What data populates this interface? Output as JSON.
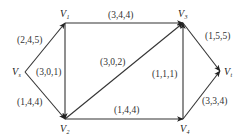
{
  "diagram": {
    "type": "flow-network",
    "nodes": [
      {
        "id": "Vs",
        "label": "V",
        "sub": "s",
        "x": 25,
        "y": 72,
        "lx": 12,
        "ly": 75
      },
      {
        "id": "V1",
        "label": "V",
        "sub": "1",
        "x": 65,
        "y": 23,
        "lx": 60,
        "ly": 17
      },
      {
        "id": "V2",
        "label": "V",
        "sub": "2",
        "x": 65,
        "y": 119,
        "lx": 60,
        "ly": 132
      },
      {
        "id": "V3",
        "label": "V",
        "sub": "3",
        "x": 183,
        "y": 23,
        "lx": 178,
        "ly": 17
      },
      {
        "id": "V4",
        "label": "V",
        "sub": "4",
        "x": 183,
        "y": 119,
        "lx": 180,
        "ly": 132
      },
      {
        "id": "Vt",
        "label": "V",
        "sub": "t",
        "x": 220,
        "y": 71,
        "lx": 224,
        "ly": 75
      }
    ],
    "edges": [
      {
        "from": "Vs",
        "to": "V1",
        "label": "(2,4,5)",
        "lx": 17,
        "ly": 43
      },
      {
        "from": "Vs",
        "to": "V2",
        "label": "(1,4,4)",
        "lx": 17,
        "ly": 105
      },
      {
        "from": "V1",
        "to": "V2",
        "label": "(3,0,1)",
        "lx": 36,
        "ly": 75
      },
      {
        "from": "V1",
        "to": "V3",
        "label": "(3,4,4)",
        "lx": 108,
        "ly": 18
      },
      {
        "from": "V2",
        "to": "V3",
        "label": "(3,0,2)",
        "lx": 100,
        "ly": 65
      },
      {
        "from": "V2",
        "to": "V4",
        "label": "(1,4,4)",
        "lx": 114,
        "ly": 113
      },
      {
        "from": "V4",
        "to": "V3",
        "label": "(1,1,1)",
        "lx": 152,
        "ly": 77
      },
      {
        "from": "V3",
        "to": "Vt",
        "label": "(1,5,5)",
        "lx": 205,
        "ly": 39
      },
      {
        "from": "V4",
        "to": "Vt",
        "label": "(3,3,4)",
        "lx": 202,
        "ly": 104
      }
    ]
  }
}
